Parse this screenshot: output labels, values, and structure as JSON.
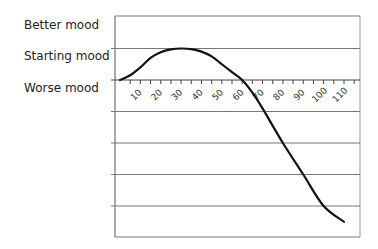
{
  "chart_data": {
    "type": "line",
    "title": "",
    "xlabel": "",
    "ylabel": "",
    "y_category_labels": [
      "Better mood",
      "Starting mood",
      "Worse mood"
    ],
    "x_ticks": [
      10,
      20,
      30,
      40,
      50,
      60,
      70,
      80,
      90,
      100,
      110
    ],
    "xlim": [
      0,
      115
    ],
    "ylim": [
      -5,
      2
    ],
    "grid": true,
    "grid_lines_y": [
      2,
      1,
      0,
      -1,
      -2,
      -3,
      -4,
      -5
    ],
    "series": [
      {
        "name": "mood",
        "x": [
          0,
          5,
          10,
          15,
          20,
          25,
          30,
          35,
          40,
          45,
          50,
          55,
          60,
          65,
          70,
          80,
          90,
          100,
          110
        ],
        "y": [
          0,
          0.15,
          0.4,
          0.7,
          0.88,
          0.97,
          1.0,
          0.98,
          0.9,
          0.75,
          0.5,
          0.25,
          0,
          -0.4,
          -0.9,
          -2.0,
          -3.0,
          -4.0,
          -4.5
        ]
      }
    ],
    "legend": null
  },
  "labels": {
    "better": "Better mood",
    "starting": "Starting mood",
    "worse": "Worse mood"
  }
}
